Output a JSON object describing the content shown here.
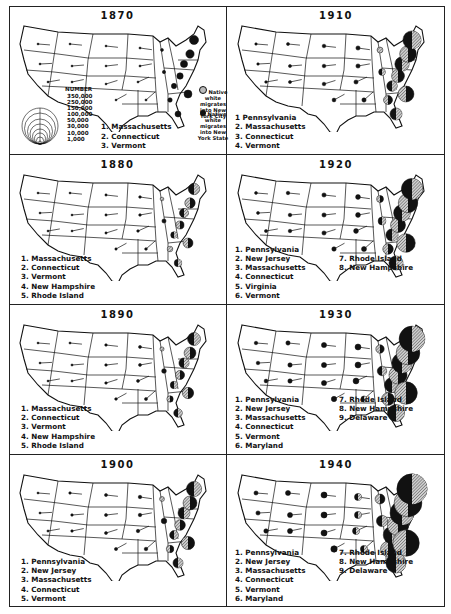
{
  "chart_data": {
    "type": "map-proportional-symbol",
    "legend": {
      "size_title": "NUMBER",
      "sizes": [
        "350,000",
        "250,000",
        "150,000",
        "100,000",
        "50,000",
        "30,000",
        "10,000",
        "1,000"
      ],
      "key": [
        {
          "label": "Native white migrates into New York City",
          "fill": "hatched"
        },
        {
          "label": "Native white migrates into New York State",
          "fill": "solid-black"
        }
      ]
    },
    "panels": [
      {
        "year": "1870",
        "top_states": [
          "Massachusetts",
          "Connecticut",
          "Vermont"
        ]
      },
      {
        "year": "1910",
        "top_states": [
          "Pennsylvania",
          "Massachusetts",
          "Connecticut",
          "Vermont"
        ]
      },
      {
        "year": "1880",
        "top_states": [
          "Massachusetts",
          "Connecticut",
          "Vermont",
          "New Hampshire",
          "Rhode Island"
        ]
      },
      {
        "year": "1920",
        "top_states": [
          "Pennsylvania",
          "New Jersey",
          "Massachusetts",
          "Connecticut",
          "Virginia",
          "Vermont",
          "Rhode Island",
          "New Hampshire"
        ]
      },
      {
        "year": "1890",
        "top_states": [
          "Massachusetts",
          "Connecticut",
          "Vermont",
          "New Hampshire",
          "Rhode Island"
        ]
      },
      {
        "year": "1930",
        "top_states": [
          "Pennsylvania",
          "New Jersey",
          "Massachusetts",
          "Connecticut",
          "Vermont",
          "Maryland",
          "Rhode Island",
          "New Hampshire",
          "Delaware"
        ]
      },
      {
        "year": "1900",
        "top_states": [
          "Pennsylvania",
          "New Jersey",
          "Massachusetts",
          "Connecticut",
          "Vermont"
        ]
      },
      {
        "year": "1940",
        "top_states": [
          "Pennsylvania",
          "New Jersey",
          "Massachusetts",
          "Connecticut",
          "Vermont",
          "Maryland",
          "Rhode Island",
          "New Hampshire",
          "Delaware"
        ]
      }
    ]
  },
  "legend": {
    "number_title": "NUMBER",
    "sizes": [
      "350,000",
      "250,000",
      "150,000",
      "100,000",
      "50,000",
      "30,000",
      "10,000",
      "1,000"
    ],
    "city_label": "Native white migrates into New York City",
    "state_label": "Native white migrates into New York State"
  },
  "panels": [
    {
      "year": "1870",
      "ranks": [
        "1.  Massachusetts",
        "2.  Connecticut",
        "3.  Vermont"
      ],
      "ranks2": []
    },
    {
      "year": "1910",
      "ranks": [
        "1   Pennsylvania",
        "2.  Massachusetts",
        "3.  Connecticut",
        "4.  Vermont"
      ],
      "ranks2": []
    },
    {
      "year": "1880",
      "ranks": [
        "1.  Massachusetts",
        "2.  Connecticut",
        "3.  Vermont",
        "4.  New Hampshire",
        "5.  Rhode Island"
      ],
      "ranks2": []
    },
    {
      "year": "1920",
      "ranks": [
        "1.  Pennsylvania",
        "2.  New Jersey",
        "3.  Massachusetts",
        "4.  Connecticut",
        "5.  Virginia",
        "6.  Vermont"
      ],
      "ranks2": [
        "7.  Rhode Island",
        "8.  New Hampshire"
      ]
    },
    {
      "year": "1890",
      "ranks": [
        "1.  Massachusetts",
        "2.  Connecticut",
        "3.  Vermont",
        "4.  New Hampshire",
        "5.  Rhode Island"
      ],
      "ranks2": []
    },
    {
      "year": "1930",
      "ranks": [
        "1.  Pennsylvania",
        "2.  New Jersey",
        "3.  Massachusetts",
        "4.  Connecticut",
        "5.  Vermont",
        "6.  Maryland"
      ],
      "ranks2": [
        "7.  Rhode Island",
        "8.  New Hampshire",
        "9.  Delaware"
      ]
    },
    {
      "year": "1900",
      "ranks": [
        "1.  Pennsylvania",
        "2.  New Jersey",
        "3.  Massachusetts",
        "4.  Connecticut",
        "5.  Vermont"
      ],
      "ranks2": []
    },
    {
      "year": "1940",
      "ranks": [
        "1.  Pennsylvania",
        "2.  New Jersey",
        "3.  Massachusetts",
        "4.  Connecticut",
        "5.  Vermont",
        "6.  Maryland"
      ],
      "ranks2": [
        "7.  Rhode Island",
        "8.  New Hampshire",
        "9.  Delaware"
      ]
    }
  ],
  "colors": {
    "ink": "#111111",
    "hatch": "#8a8a8a",
    "paper": "#ffffff"
  }
}
